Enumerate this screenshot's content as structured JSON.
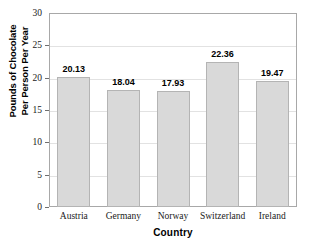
{
  "chart_data": {
    "type": "bar",
    "title": "",
    "categories": [
      "Austria",
      "Germany",
      "Norway",
      "Switzerland",
      "Ireland"
    ],
    "values": [
      20.13,
      18.04,
      17.93,
      22.36,
      19.47
    ],
    "value_labels": [
      "20.13",
      "18.04",
      "17.93",
      "22.36",
      "19.47"
    ],
    "xlabel": "Country",
    "ylabel": "Pounds of Chocolate Per Person Per Year",
    "ylabel_line1": "Pounds of Chocolate",
    "ylabel_line2": "Per Person Per Year",
    "ylim": [
      0,
      30
    ],
    "ytick_step": 5,
    "yticks": [
      0,
      5,
      10,
      15,
      20,
      25,
      30
    ],
    "ytick_labels": [
      "0",
      "5",
      "10",
      "15",
      "20",
      "25",
      "30"
    ],
    "grid": true,
    "legend": false,
    "bar_color": "#d9d9d9",
    "bar_border_color": "#b4b4b4",
    "gridline_color": "#e2e2e2",
    "frame_color": "#a8a8a8",
    "background_color": "#ffffff",
    "text_color": "#000000"
  }
}
